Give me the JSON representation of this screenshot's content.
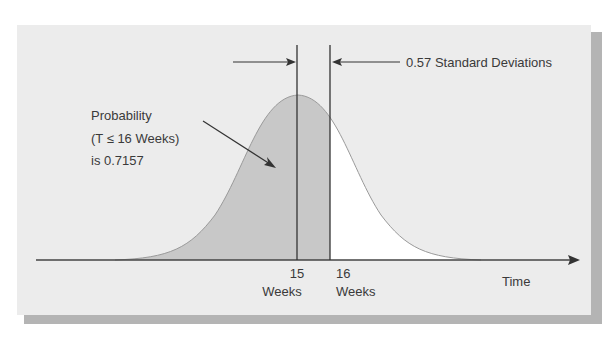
{
  "figure": {
    "annotation_std": "0.57 Standard Deviations",
    "probability_label": {
      "line1": "Probability",
      "line2": "(T ≤ 16 Weeks)",
      "line3": "is 0.7157"
    },
    "x_axis_label": "Time",
    "markers": [
      {
        "value": "15",
        "unit": "Weeks"
      },
      {
        "value": "16",
        "unit": "Weeks"
      }
    ],
    "colors": {
      "panel": "#ececec",
      "shaded_area": "#c8c8c8",
      "unshaded_area": "#ffffff",
      "lines": "#333333",
      "shadow": "#b4b4b4"
    }
  }
}
